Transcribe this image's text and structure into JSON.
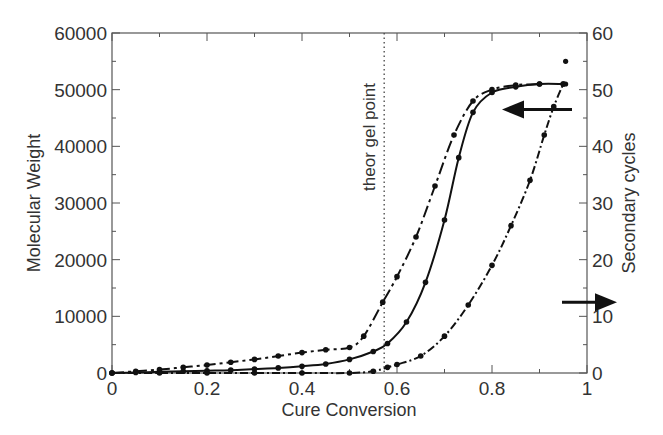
{
  "chart_data": {
    "type": "line",
    "title": "",
    "xlabel": "Cure Conversion",
    "ylabel": "Molecular Weight",
    "ylabel_right": "Secondary cycles",
    "xlim": [
      0,
      1
    ],
    "ylim": [
      0,
      60000
    ],
    "ylim_right": [
      0,
      60
    ],
    "x_ticks": [
      "0",
      "0.2",
      "0.4",
      "0.6",
      "0.8",
      "1"
    ],
    "y_ticks": [
      "0",
      "10000",
      "20000",
      "30000",
      "40000",
      "50000",
      "60000"
    ],
    "y_ticks_right": [
      "0",
      "10",
      "20",
      "30",
      "40",
      "50",
      "60"
    ],
    "grid": false,
    "annotations": [
      {
        "text": "theor gel point",
        "type": "vertical-dotted-line",
        "x": 0.573
      },
      {
        "text": "",
        "type": "arrow-left",
        "meaning": "solid/dashed curves read left axis",
        "x": 0.88,
        "y": 46500
      },
      {
        "text": "",
        "type": "arrow-right",
        "meaning": "dash-dot curve reads right axis",
        "x": 0.98,
        "y": 12500
      }
    ],
    "series": [
      {
        "name": "Molecular weight (solid, left axis)",
        "style": "solid",
        "axis": "left",
        "x": [
          0.0,
          0.05,
          0.1,
          0.15,
          0.2,
          0.25,
          0.3,
          0.35,
          0.4,
          0.45,
          0.5,
          0.55,
          0.58,
          0.62,
          0.66,
          0.7,
          0.73,
          0.76,
          0.8,
          0.85,
          0.9,
          0.95
        ],
        "values": [
          0,
          100,
          200,
          300,
          400,
          500,
          700,
          900,
          1200,
          1600,
          2400,
          3800,
          5200,
          9000,
          16000,
          27000,
          38000,
          46000,
          49500,
          50500,
          51000,
          51000
        ]
      },
      {
        "name": "Molecular weight (dashed, left axis)",
        "style": "dash-dot-long",
        "axis": "left",
        "x": [
          0.0,
          0.05,
          0.1,
          0.15,
          0.2,
          0.25,
          0.3,
          0.35,
          0.4,
          0.45,
          0.5,
          0.53,
          0.57,
          0.6,
          0.64,
          0.68,
          0.72,
          0.76,
          0.8,
          0.85,
          0.9
        ],
        "values": [
          0,
          300,
          600,
          1000,
          1400,
          1900,
          2400,
          3000,
          3600,
          4100,
          4500,
          6500,
          12500,
          17000,
          24000,
          33000,
          42000,
          48000,
          50000,
          50800,
          51000
        ]
      },
      {
        "name": "Secondary cycles (dash-dot, right axis)",
        "style": "dash-dot",
        "axis": "right",
        "x": [
          0.0,
          0.1,
          0.2,
          0.3,
          0.4,
          0.5,
          0.55,
          0.58,
          0.6,
          0.65,
          0.7,
          0.75,
          0.8,
          0.84,
          0.88,
          0.91,
          0.93,
          0.95
        ],
        "values": [
          0,
          0,
          0,
          0,
          0,
          0,
          0.3,
          1,
          1.5,
          3,
          6.5,
          12,
          19,
          26,
          34,
          42,
          47,
          51
        ]
      }
    ],
    "outlier_points": [
      {
        "x": 0.955,
        "y_right": 55
      },
      {
        "x": 0.955,
        "y_right": 51
      }
    ]
  }
}
